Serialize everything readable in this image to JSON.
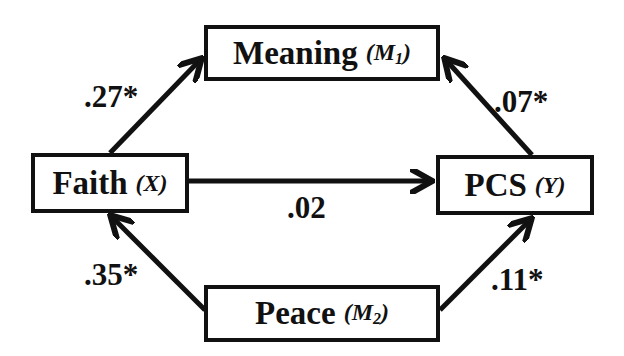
{
  "nodes": {
    "meaning": {
      "label": "Meaning",
      "var_open": "(",
      "var_letter": "M",
      "var_sub": "1",
      "var_close": ")"
    },
    "faith": {
      "label": "Faith",
      "var_open": "(",
      "var_letter": "X",
      "var_sub": "",
      "var_close": ")"
    },
    "pcs": {
      "label": "PCS",
      "var_open": "(",
      "var_letter": "Y",
      "var_sub": "",
      "var_close": ")"
    },
    "peace": {
      "label": "Peace",
      "var_open": "(",
      "var_letter": "M",
      "var_sub": "2",
      "var_close": ")"
    }
  },
  "edges": {
    "faith_to_meaning": {
      "coef": ".27*"
    },
    "meaning_from_pcs": {
      "coef": ".07*"
    },
    "faith_to_pcs": {
      "coef": ".02"
    },
    "peace_to_faith": {
      "coef": ".35*"
    },
    "peace_to_pcs": {
      "coef": ".11*"
    }
  },
  "colors": {
    "stroke": "#111111",
    "background": "#ffffff"
  }
}
